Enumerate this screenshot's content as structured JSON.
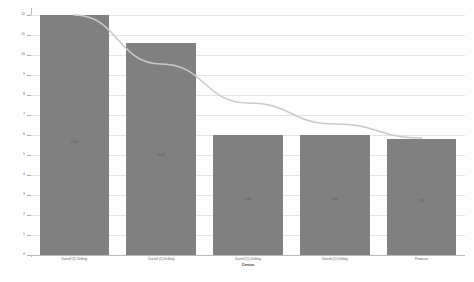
{
  "chart_data": {
    "type": "bar",
    "title": "",
    "xlabel": "Census",
    "ylabel": "",
    "ylim": [
      0,
      12
    ],
    "grid": true,
    "legend": "none",
    "categories": [
      "Darrell (1) Drilling",
      "Darrell (1) Drilling",
      "Darrell (1) Drilling",
      "Darrell (1) Drilling",
      "Producer"
    ],
    "values": [
      12.0,
      10.6,
      6.0,
      6.0,
      5.8
    ],
    "bar_labels": [
      "12.00",
      "10.60",
      "6.00",
      "6.00",
      "5.80"
    ],
    "ytick_labels": [
      "0",
      "1",
      "2",
      "3",
      "4",
      "5",
      "6",
      "7",
      "8",
      "9",
      "10",
      "11",
      "12"
    ],
    "yticks": [
      0,
      1,
      2,
      3,
      4,
      5,
      6,
      7,
      8,
      9,
      10,
      11,
      12
    ],
    "series": [
      {
        "name": "Value",
        "type": "bar",
        "values": [
          12.0,
          10.6,
          6.0,
          6.0,
          5.8
        ],
        "color": "#808080"
      },
      {
        "name": "Trend",
        "type": "line",
        "values": [
          12.0,
          9.55,
          7.6,
          6.55,
          5.85
        ],
        "color": "#c9c9c9"
      }
    ],
    "bar_color": "#808080",
    "trend_color": "#c9c9c9",
    "grid_color": "#e3e3e3",
    "axis_color": "#b9b9b9"
  }
}
